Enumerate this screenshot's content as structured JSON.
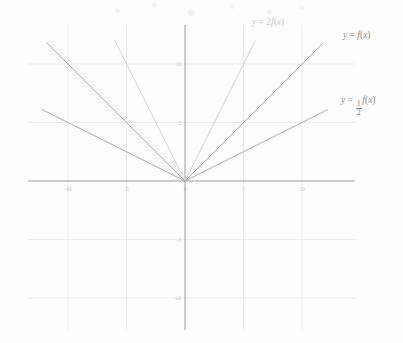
{
  "figure": {
    "background_color": "#fdfdfc",
    "axis_color": "#9a9a9a",
    "grid_color": "#ebebeb",
    "tick_label_color": "#b9b9b9"
  },
  "chart_data": {
    "type": "line",
    "title": "",
    "subtitle": "",
    "xlabel": "",
    "ylabel": "",
    "xlim": [
      -14,
      14
    ],
    "ylim": [
      -13,
      12
    ],
    "grid": true,
    "legend": "inline-curve-labels",
    "xticks": [
      -10,
      -5,
      0,
      5,
      10
    ],
    "xtick_labels": [
      "-10",
      "-5",
      "0",
      "5",
      "10"
    ],
    "yticks": [
      10,
      5,
      -5,
      -10
    ],
    "ytick_labels": [
      "10",
      "5",
      "-5",
      "-10"
    ],
    "series": [
      {
        "name": "y = 2f(x)",
        "label_html": "<i>y</i> = 2<i>f</i>(<i>x</i>)",
        "slope": 2,
        "shape": "absolute-value",
        "color": "#d2d2d2",
        "points": [
          [
            -6,
            12
          ],
          [
            0,
            0
          ],
          [
            6,
            12
          ]
        ],
        "label_position": {
          "x": 252,
          "y": 17
        }
      },
      {
        "name": "y = f(x)",
        "label_html": "<i>y</i> = <i>f</i>(<i>x</i>)",
        "slope": 1,
        "shape": "absolute-value",
        "color": "#a8a8a8",
        "points": [
          [
            -11.8,
            11.8
          ],
          [
            0,
            0
          ],
          [
            11.8,
            11.8
          ]
        ],
        "label_position": {
          "x": 343,
          "y": 30
        }
      },
      {
        "name": "y = 1/2 f(x)",
        "label_html": "<i>y</i> = <span class=\"frac\"><span class=\"num\">1</span><span class=\"den\">2</span></span><i>f</i>(<i>x</i>)",
        "slope": 0.5,
        "shape": "absolute-value",
        "color": "#a8a8a8",
        "points": [
          [
            -12.2,
            6.1
          ],
          [
            0,
            0
          ],
          [
            12.2,
            6.1
          ]
        ],
        "label_position": {
          "x": 341,
          "y": 95
        }
      }
    ]
  }
}
